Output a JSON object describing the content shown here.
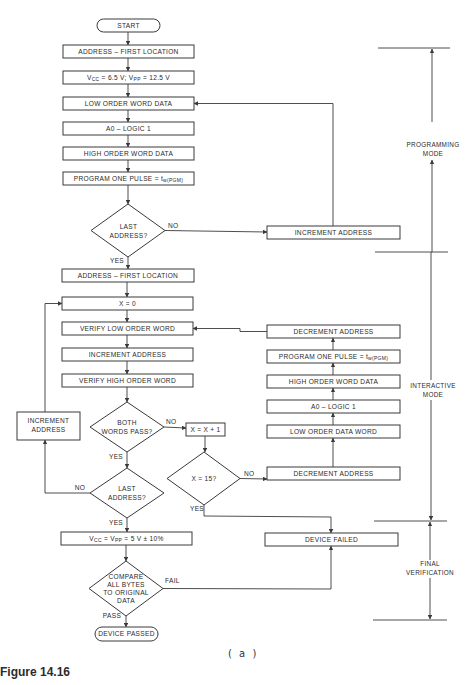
{
  "figure": {
    "caption": "Figure 14.16",
    "sublabel": "( a )"
  },
  "modes": {
    "programming": [
      "PROGRAMMING",
      "MODE"
    ],
    "interactive": [
      "INTERACTIVE",
      "MODE"
    ],
    "final": [
      "FINAL",
      "VERIFICATION"
    ]
  },
  "main": {
    "start": "START",
    "addr_first_1": "ADDRESS  –  FIRST LOCATION",
    "vcc_prog": {
      "a": "V",
      "a_sub": "CC",
      "b": " = 6.5 V; V",
      "b_sub": "PP",
      "c": " = 12.5 V"
    },
    "low_order_word_data": "LOW ORDER WORD DATA",
    "a0_logic1": "A0  –  LOGIC 1",
    "high_order_word_data": "HIGH ORDER WORD DATA",
    "program_pulse": {
      "a": "PROGRAM ONE PULSE = t",
      "a_sub": "w(PGM)"
    },
    "last_address_1": [
      "LAST",
      "ADDRESS?"
    ],
    "addr_first_2": "ADDRESS  –  FIRST LOCATION",
    "x_zero": "X  =  0",
    "verify_low": "VERIFY LOW ORDER WORD",
    "increment_address": "INCREMENT ADDRESS",
    "verify_high": "VERIFY HIGH ORDER WORD",
    "both_words_pass": [
      "BOTH",
      "WORDS PASS?"
    ],
    "last_address_2": [
      "LAST",
      "ADDRESS?"
    ],
    "vcc_verify": {
      "a": "V",
      "a_sub": "CC",
      "b": " = V",
      "b_sub": "PP",
      "c": " = 5 V ± 10%"
    },
    "compare": [
      "COMPARE",
      "ALL BYTES",
      "TO ORIGINAL",
      "DATA"
    ],
    "device_passed": "DEVICE PASSED"
  },
  "left": {
    "increment_address": [
      "INCREMENT",
      "ADDRESS"
    ]
  },
  "middle": {
    "x_plus_1": "X  =  X + 1",
    "x_15": "X  =  15?"
  },
  "right": {
    "increment_address": "INCREMENT   ADDRESS",
    "decrement_address_1": "DECREMENT ADDRESS",
    "program_pulse": {
      "a": "PROGRAM ONE PULSE = t",
      "a_sub": "w(PGM)"
    },
    "high_order_word_data": "HIGH ORDER WORD DATA",
    "a0_logic1": "A0  –  LOGIC 1",
    "low_order_data_word": "LOW ORDER DATA WORD",
    "decrement_address_2": "DECREMENT ADDRESS",
    "device_failed": "DEVICE FAILED"
  },
  "edges": {
    "no": "NO",
    "yes": "YES",
    "fail": "FAIL",
    "pass": "PASS"
  }
}
